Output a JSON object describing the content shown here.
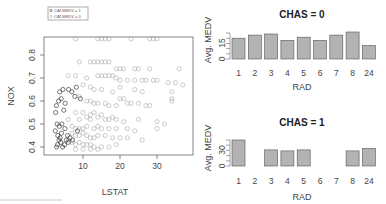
{
  "chart_data": [
    {
      "type": "scatter",
      "title": "",
      "xlabel": "LSTAT",
      "ylabel": "NOX",
      "xlim": [
        1.7,
        38
      ],
      "ylim": [
        0.385,
        0.871
      ],
      "xticks": [
        10,
        20,
        30
      ],
      "yticks": [
        0.4,
        0.5,
        0.6,
        0.7,
        0.8
      ],
      "grid": false,
      "legend": {
        "position": "top-left, outside frame",
        "entries": [
          "CAT.MEDV = 1",
          "CAT.MEDV = 0"
        ]
      },
      "series": [
        {
          "name": "CAT.MEDV = 1",
          "color": "#222222",
          "marker": "open-circle",
          "points": [
            [
              2.9,
              0.4
            ],
            [
              3.1,
              0.41
            ],
            [
              3.5,
              0.43
            ],
            [
              4.0,
              0.42
            ],
            [
              4.5,
              0.4
            ],
            [
              5.0,
              0.41
            ],
            [
              3.2,
              0.45
            ],
            [
              3.8,
              0.44
            ],
            [
              4.2,
              0.46
            ],
            [
              5.5,
              0.43
            ],
            [
              6.0,
              0.42
            ],
            [
              2.5,
              0.47
            ],
            [
              3.0,
              0.5
            ],
            [
              3.6,
              0.49
            ],
            [
              4.3,
              0.5
            ],
            [
              5.1,
              0.48
            ],
            [
              5.8,
              0.45
            ],
            [
              6.5,
              0.44
            ],
            [
              7.2,
              0.43
            ],
            [
              2.8,
              0.58
            ],
            [
              3.4,
              0.6
            ],
            [
              4.1,
              0.61
            ],
            [
              5.2,
              0.59
            ],
            [
              3.7,
              0.64
            ],
            [
              4.6,
              0.65
            ],
            [
              6.1,
              0.65
            ],
            [
              7.0,
              0.64
            ],
            [
              8.2,
              0.66
            ],
            [
              2.6,
              0.55
            ],
            [
              4.8,
              0.56
            ],
            [
              8.5,
              0.47
            ],
            [
              9.3,
              0.61
            ],
            [
              7.8,
              0.62
            ]
          ]
        },
        {
          "name": "CAT.MEDV = 0",
          "color": "#aaaaaa",
          "marker": "open-circle",
          "points": [
            [
              8,
              0.87
            ],
            [
              14,
              0.87
            ],
            [
              15,
              0.87
            ],
            [
              16,
              0.87
            ],
            [
              17,
              0.87
            ],
            [
              23,
              0.87
            ],
            [
              28,
              0.87
            ],
            [
              29,
              0.87
            ],
            [
              30,
              0.87
            ],
            [
              9,
              0.77
            ],
            [
              12,
              0.77
            ],
            [
              13,
              0.77
            ],
            [
              14,
              0.77
            ],
            [
              15,
              0.77
            ],
            [
              16,
              0.77
            ],
            [
              17,
              0.77
            ],
            [
              19,
              0.74
            ],
            [
              20,
              0.74
            ],
            [
              21,
              0.74
            ],
            [
              24,
              0.74
            ],
            [
              25,
              0.74
            ],
            [
              28,
              0.74
            ],
            [
              36,
              0.74
            ],
            [
              6,
              0.71
            ],
            [
              8,
              0.71
            ],
            [
              11,
              0.7
            ],
            [
              14,
              0.71
            ],
            [
              15,
              0.71
            ],
            [
              16,
              0.71
            ],
            [
              17,
              0.71
            ],
            [
              18,
              0.71
            ],
            [
              19,
              0.7
            ],
            [
              20,
              0.69
            ],
            [
              22,
              0.69
            ],
            [
              24,
              0.69
            ],
            [
              26,
              0.69
            ],
            [
              27,
              0.69
            ],
            [
              29,
              0.69
            ],
            [
              30,
              0.69
            ],
            [
              33,
              0.68
            ],
            [
              35,
              0.68
            ],
            [
              37,
              0.67
            ],
            [
              10,
              0.67
            ],
            [
              12,
              0.66
            ],
            [
              13,
              0.65
            ],
            [
              15,
              0.65
            ],
            [
              18,
              0.64
            ],
            [
              20,
              0.66
            ],
            [
              24,
              0.65
            ],
            [
              26,
              0.64
            ],
            [
              34,
              0.64
            ],
            [
              34,
              0.61
            ],
            [
              34,
              0.6
            ],
            [
              9,
              0.62
            ],
            [
              11,
              0.6
            ],
            [
              12,
              0.6
            ],
            [
              13,
              0.59
            ],
            [
              14,
              0.59
            ],
            [
              16,
              0.59
            ],
            [
              17,
              0.58
            ],
            [
              19,
              0.58
            ],
            [
              20,
              0.61
            ],
            [
              21,
              0.61
            ],
            [
              22,
              0.59
            ],
            [
              23,
              0.59
            ],
            [
              25,
              0.59
            ],
            [
              27,
              0.58
            ],
            [
              28,
              0.58
            ],
            [
              8,
              0.55
            ],
            [
              10,
              0.55
            ],
            [
              12,
              0.54
            ],
            [
              13,
              0.55
            ],
            [
              15,
              0.54
            ],
            [
              6,
              0.52
            ],
            [
              9,
              0.52
            ],
            [
              11,
              0.53
            ],
            [
              12,
              0.52
            ],
            [
              14,
              0.53
            ],
            [
              16,
              0.52
            ],
            [
              17,
              0.52
            ],
            [
              18,
              0.53
            ],
            [
              19,
              0.52
            ],
            [
              21,
              0.51
            ],
            [
              25,
              0.52
            ],
            [
              30,
              0.51
            ],
            [
              32,
              0.5
            ],
            [
              7,
              0.49
            ],
            [
              8,
              0.48
            ],
            [
              9,
              0.48
            ],
            [
              10,
              0.48
            ],
            [
              11,
              0.49
            ],
            [
              13,
              0.48
            ],
            [
              14,
              0.49
            ],
            [
              15,
              0.48
            ],
            [
              17,
              0.48
            ],
            [
              19,
              0.48
            ],
            [
              22,
              0.48
            ],
            [
              24,
              0.47
            ],
            [
              30,
              0.48
            ],
            [
              7,
              0.46
            ],
            [
              8,
              0.45
            ],
            [
              9,
              0.45
            ],
            [
              10,
              0.46
            ],
            [
              11,
              0.45
            ],
            [
              12,
              0.44
            ],
            [
              13,
              0.44
            ],
            [
              14,
              0.45
            ],
            [
              16,
              0.45
            ],
            [
              18,
              0.44
            ],
            [
              20,
              0.44
            ],
            [
              22,
              0.44
            ],
            [
              26,
              0.43
            ],
            [
              6,
              0.43
            ],
            [
              7,
              0.42
            ],
            [
              8,
              0.41
            ],
            [
              9,
              0.42
            ],
            [
              10,
              0.41
            ],
            [
              11,
              0.41
            ],
            [
              12,
              0.41
            ],
            [
              13,
              0.4
            ],
            [
              15,
              0.4
            ],
            [
              17,
              0.4
            ],
            [
              19,
              0.41
            ],
            [
              8,
              0.39
            ],
            [
              10,
              0.39
            ],
            [
              12,
              0.39
            ],
            [
              14,
              0.39
            ]
          ]
        }
      ]
    },
    {
      "type": "bar",
      "title": "CHAS = 0",
      "xlabel": "RAD",
      "ylabel": "Avg. MEDV",
      "categories": [
        "1",
        "2",
        "3",
        "4",
        "5",
        "6",
        "7",
        "8",
        "24"
      ],
      "values": [
        20,
        23,
        24,
        18,
        21,
        18,
        23,
        26,
        13
      ],
      "ylim": [
        0,
        26
      ],
      "yticks_labeled": [
        0,
        15
      ],
      "yticks_minor": [
        0,
        5,
        10,
        15,
        20,
        25
      ],
      "bar_color": "#b3b3b3",
      "grid": false
    },
    {
      "type": "bar",
      "title": "CHAS = 1",
      "xlabel": "RAD",
      "ylabel": "Avg. MEDV",
      "categories": [
        "1",
        "2",
        "3",
        "4",
        "5",
        "6",
        "7",
        "8",
        "24"
      ],
      "values": [
        50,
        0,
        31,
        29,
        31,
        0,
        0,
        29,
        34
      ],
      "ylim": [
        0,
        52
      ],
      "yticks_labeled": [
        0,
        30
      ],
      "yticks_minor": [
        0,
        10,
        20,
        30,
        40,
        50
      ],
      "bar_color": "#b3b3b3",
      "grid": false
    }
  ],
  "scatter": {
    "xlabel": "LSTAT",
    "ylabel": "NOX",
    "xticks": [
      "10",
      "20",
      "30"
    ],
    "yticks": [
      "0.4",
      "0.5",
      "0.6",
      "0.7",
      "0.8"
    ],
    "legend": [
      "CAT.MEDV = 1",
      "CAT.MEDV = 0"
    ]
  },
  "bar_top": {
    "title": "CHAS = 0",
    "xlabel": "RAD",
    "ylabel": "Avg. MEDV",
    "ytick_low": "0",
    "ytick_high": "15"
  },
  "bar_bottom": {
    "title": "CHAS = 1",
    "xlabel": "RAD",
    "ylabel": "Avg. MEDV",
    "ytick_low": "0",
    "ytick_high": "30"
  }
}
